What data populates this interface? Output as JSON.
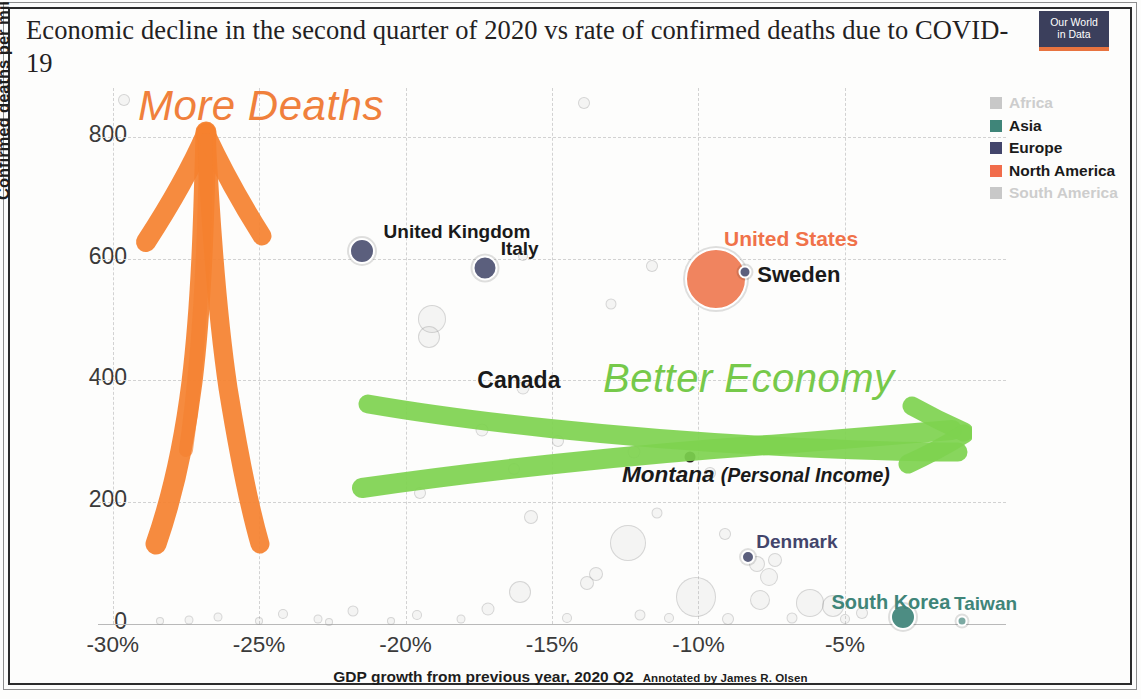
{
  "header": {
    "title": "Economic decline in the second quarter of 2020 vs rate of confirmed deaths due to COVID-19",
    "logo_line1": "Our World",
    "logo_line2": "in Data"
  },
  "axes": {
    "y_label": "Confirmed deaths per million people (Aug 30)",
    "y_ticks": [
      "0",
      "200",
      "400",
      "600",
      "800"
    ],
    "y_tick_values": [
      0,
      200,
      400,
      600,
      800
    ],
    "y_min": 0,
    "y_max": 880,
    "x_label": "GDP growth from previous year, 2020 Q2",
    "x_credit": "Annotated by James R. Olsen",
    "x_ticks": [
      "-30%",
      "-25%",
      "-20%",
      "-15%",
      "-10%",
      "-5%"
    ],
    "x_tick_values": [
      -30,
      -25,
      -20,
      -15,
      -10,
      -5
    ],
    "x_min": -30.5,
    "x_max": 0.5
  },
  "legend": {
    "items": [
      {
        "label": "Africa",
        "color": "#c8c8c8",
        "muted": true
      },
      {
        "label": "Asia",
        "color": "#3f8579",
        "muted": false
      },
      {
        "label": "Europe",
        "color": "#43456b",
        "muted": false
      },
      {
        "label": "North America",
        "color": "#f16c4b",
        "muted": false
      },
      {
        "label": "South America",
        "color": "#c8c8c8",
        "muted": true
      }
    ]
  },
  "annotations": [
    {
      "name": "more-deaths",
      "text": "More Deaths",
      "color": "#f0803c"
    },
    {
      "name": "better-economy",
      "text": "Better Economy",
      "color": "#76c94a"
    },
    {
      "name": "montana",
      "text": "Montana",
      "paren": "(Personal Income)",
      "color": "#1a1a1a"
    }
  ],
  "chart_data": {
    "type": "scatter",
    "title": "Economic decline in the second quarter of 2020 vs rate of confirmed deaths due to COVID-19",
    "xlabel": "GDP growth from previous year, 2020 Q2",
    "ylabel": "Confirmed deaths per million people (Aug 30)",
    "xlim": [
      -30.5,
      0.5
    ],
    "ylim": [
      0,
      880
    ],
    "grid": true,
    "legend_position": "right",
    "legend": [
      "Africa",
      "Asia",
      "Europe",
      "North America",
      "South America"
    ],
    "bubble_size_meaning": "population",
    "labeled_points": [
      {
        "label": "United Kingdom",
        "x": -21.5,
        "y": 612,
        "region": "Europe",
        "color": "#5b5f7d",
        "size": 26,
        "label_color": "#1a1a1a",
        "label_dx": 22,
        "label_dy": -30,
        "label_size": 19
      },
      {
        "label": "Italy",
        "x": -17.3,
        "y": 585,
        "region": "Europe",
        "color": "#5b5f7d",
        "size": 25,
        "label_color": "#1a1a1a",
        "label_dx": 16,
        "label_dy": -30,
        "label_size": 19
      },
      {
        "label": "United States",
        "x": -9.4,
        "y": 567,
        "region": "North America",
        "color": "#f0845f",
        "size": 62,
        "label_color": "#f0724a",
        "label_dx": 8,
        "label_dy": -52,
        "label_size": 21
      },
      {
        "label": "Sweden",
        "x": -8.4,
        "y": 578,
        "region": "Europe",
        "color": "#5b5f7d",
        "size": 13,
        "label_color": "#1a1a1a",
        "label_dx": 12,
        "label_dy": -10,
        "label_size": 22
      },
      {
        "label": "Canada",
        "x": -15.5,
        "y": 400,
        "region": "North America",
        "color": null,
        "size": 0,
        "label_color": "#1a1a1a",
        "label_dx": -60,
        "label_dy": -13,
        "label_size": 23
      },
      {
        "label": "Denmark",
        "x": -8.3,
        "y": 110,
        "region": "Europe",
        "color": "#5b5f7d",
        "size": 14,
        "label_color": "#43456b",
        "label_dx": 8,
        "label_dy": -26,
        "label_size": 19
      },
      {
        "label": "South Korea",
        "x": -3.0,
        "y": 12,
        "region": "Asia",
        "color": "#4d8d83",
        "size": 26,
        "label_color": "#3f8579",
        "label_dx": -72,
        "label_dy": -26,
        "label_size": 20
      },
      {
        "label": "Taiwan",
        "x": -1.0,
        "y": 5,
        "region": "Asia",
        "color": "#7ba9a2",
        "size": 11,
        "label_color": "#3f8579",
        "label_dx": -8,
        "label_dy": -28,
        "label_size": 19
      },
      {
        "label": "Montana (Personal Income)",
        "x": -10.3,
        "y": 275,
        "region": "North America",
        "color": "#231f1c",
        "size": 11,
        "label_color": "#1a1a1a",
        "label_dx": 0,
        "label_dy": 0,
        "label_size": 22
      }
    ],
    "unlabeled_points": [
      {
        "x": -29.6,
        "y": 860,
        "size": 12
      },
      {
        "x": -13.9,
        "y": 855,
        "size": 12
      },
      {
        "x": -16.0,
        "y": 605,
        "size": 10
      },
      {
        "x": -11.6,
        "y": 588,
        "size": 12
      },
      {
        "x": -13.0,
        "y": 525,
        "size": 11
      },
      {
        "x": -19.1,
        "y": 500,
        "size": 28
      },
      {
        "x": -19.2,
        "y": 472,
        "size": 22
      },
      {
        "x": -16.0,
        "y": 388,
        "size": 13
      },
      {
        "x": -17.4,
        "y": 318,
        "size": 13
      },
      {
        "x": -14.8,
        "y": 300,
        "size": 12
      },
      {
        "x": -12.2,
        "y": 282,
        "size": 13
      },
      {
        "x": -16.3,
        "y": 255,
        "size": 12
      },
      {
        "x": -9.6,
        "y": 248,
        "size": 12
      },
      {
        "x": -19.5,
        "y": 215,
        "size": 12
      },
      {
        "x": -11.4,
        "y": 183,
        "size": 11
      },
      {
        "x": -15.7,
        "y": 175,
        "size": 14
      },
      {
        "x": -9.1,
        "y": 148,
        "size": 12
      },
      {
        "x": -12.4,
        "y": 133,
        "size": 36
      },
      {
        "x": -7.4,
        "y": 105,
        "size": 14
      },
      {
        "x": -8.0,
        "y": 98,
        "size": 16
      },
      {
        "x": -7.6,
        "y": 77,
        "size": 18
      },
      {
        "x": -13.5,
        "y": 82,
        "size": 14
      },
      {
        "x": -13.8,
        "y": 68,
        "size": 14
      },
      {
        "x": -16.1,
        "y": 52,
        "size": 22
      },
      {
        "x": -10.1,
        "y": 45,
        "size": 40
      },
      {
        "x": -7.9,
        "y": 40,
        "size": 20
      },
      {
        "x": -6.2,
        "y": 35,
        "size": 28
      },
      {
        "x": -5.4,
        "y": 30,
        "size": 22
      },
      {
        "x": -17.2,
        "y": 24,
        "size": 13
      },
      {
        "x": -21.8,
        "y": 22,
        "size": 11
      },
      {
        "x": -24.2,
        "y": 16,
        "size": 10
      },
      {
        "x": -26.4,
        "y": 12,
        "size": 9
      },
      {
        "x": -19.6,
        "y": 14,
        "size": 10
      },
      {
        "x": -12.0,
        "y": 14,
        "size": 11
      },
      {
        "x": -11.0,
        "y": 10,
        "size": 10
      },
      {
        "x": -14.5,
        "y": 10,
        "size": 10
      },
      {
        "x": -4.4,
        "y": 18,
        "size": 12
      },
      {
        "x": -23.0,
        "y": 8,
        "size": 9
      },
      {
        "x": -27.4,
        "y": 7,
        "size": 9
      },
      {
        "x": -5.0,
        "y": 8,
        "size": 10
      },
      {
        "x": -18.1,
        "y": 8,
        "size": 9
      },
      {
        "x": -9.0,
        "y": 8,
        "size": 12
      },
      {
        "x": -6.8,
        "y": 10,
        "size": 11
      },
      {
        "x": -25.0,
        "y": 5,
        "size": 8
      },
      {
        "x": -28.4,
        "y": 5,
        "size": 8
      },
      {
        "x": -20.5,
        "y": 5,
        "size": 8
      },
      {
        "x": -22.6,
        "y": 4,
        "size": 8
      }
    ]
  }
}
